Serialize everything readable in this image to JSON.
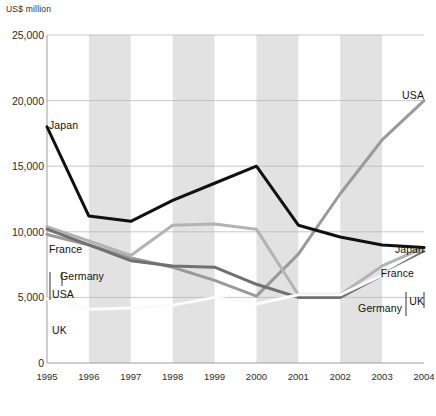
{
  "chart_data": {
    "type": "line",
    "title": "",
    "subtitle": "",
    "ylabel": "US$ million",
    "xlabel": "",
    "ylim": [
      0,
      25000
    ],
    "ytick_labels": [
      "0",
      "5,000",
      "10,000",
      "15,000",
      "20,000",
      "25,000"
    ],
    "ytick_values": [
      0,
      5000,
      10000,
      15000,
      20000,
      25000
    ],
    "grid": true,
    "grid_bands": "alternating vertical grey bands",
    "legend_position": "inline end-of-line labels, left and right",
    "categories": [
      "1995",
      "1996",
      "1997",
      "1998",
      "1999",
      "2000",
      "2001",
      "2002",
      "2003",
      "2004"
    ],
    "x": [
      1995,
      1996,
      1997,
      1998,
      1999,
      2000,
      2001,
      2002,
      2003,
      2004
    ],
    "series": [
      {
        "name": "Japan",
        "color": "#111111",
        "width": 3.0,
        "values": [
          18000,
          11200,
          10800,
          12400,
          13700,
          15000,
          10500,
          9600,
          9000,
          8800
        ]
      },
      {
        "name": "USA",
        "color": "#9a9a9a",
        "width": 3.0,
        "values": [
          9800,
          9000,
          8000,
          7300,
          6300,
          5100,
          8300,
          12900,
          17000,
          20000
        ]
      },
      {
        "name": "France",
        "color": "#b3b3b3",
        "width": 3.0,
        "values": [
          10400,
          9300,
          8200,
          10500,
          10600,
          10200,
          5200,
          5200,
          7400,
          8800
        ]
      },
      {
        "name": "Germany",
        "color": "#707070",
        "width": 3.0,
        "values": [
          10200,
          9000,
          7800,
          7400,
          7300,
          6000,
          5000,
          5000,
          6700,
          8500
        ]
      },
      {
        "name": "UK",
        "color": "#fbfbfb",
        "width": 3.0,
        "values": [
          4900,
          4100,
          4200,
          4400,
          5000,
          4500,
          5200,
          5200,
          6700,
          8300
        ]
      }
    ],
    "left_labels": [
      {
        "name": "Japan",
        "value": 18000
      },
      {
        "name": "France",
        "value": 10400
      },
      {
        "name": "Germany",
        "value": 10200
      },
      {
        "name": "USA",
        "value": 9800
      },
      {
        "name": "UK",
        "value": 4900
      }
    ],
    "right_labels": [
      {
        "name": "USA",
        "value": 20000
      },
      {
        "name": "Japan",
        "value": 8800
      },
      {
        "name": "France",
        "value": 8800
      },
      {
        "name": "Germany",
        "value": 8500
      },
      {
        "name": "UK",
        "value": 8300
      }
    ]
  },
  "labels": {
    "unit": "US$ million",
    "left": {
      "japan": "Japan",
      "france": "France",
      "germany": "Germany",
      "usa": "USA",
      "uk": "UK"
    },
    "right": {
      "usa": "USA",
      "japan": "Japan",
      "france": "France",
      "germany": "Germany",
      "uk": "UK"
    }
  }
}
